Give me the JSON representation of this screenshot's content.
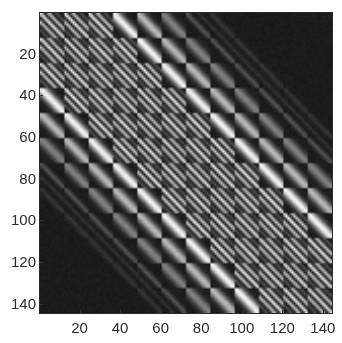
{
  "chart_data": {
    "type": "heatmap",
    "title": "",
    "xlabel": "",
    "ylabel": "",
    "colormap": "gray",
    "matrix_size": [
      144,
      144
    ],
    "block_size": 12,
    "num_blocks": 12,
    "xlim": [
      0.5,
      144.5
    ],
    "ylim": [
      144.5,
      0.5
    ],
    "y_axis_reversed": true,
    "x_ticks": [
      20,
      40,
      60,
      80,
      100,
      120,
      140
    ],
    "y_ticks": [
      20,
      40,
      60,
      80,
      100,
      120,
      140
    ],
    "x_tick_labels": [
      "20",
      "40",
      "60",
      "80",
      "100",
      "120",
      "140"
    ],
    "y_tick_labels": [
      "20",
      "40",
      "60",
      "80",
      "100",
      "120",
      "140"
    ],
    "grid": false,
    "legend": null,
    "structure": {
      "description": "12x12 block-banded matrix; each 12x12 block shows stripes parallel to the main diagonal with dark off-diagonal corners, giving a checkerboard look",
      "stripes_by_block_offset": [
        3,
        3,
        3,
        1,
        1,
        1,
        1,
        1,
        0,
        0,
        0,
        0
      ],
      "brightness_by_block_offset": [
        0.78,
        0.8,
        0.82,
        0.85,
        0.62,
        0.4,
        0.22,
        0.1,
        0.0,
        0.0,
        0.0,
        0.0
      ],
      "faint_diagonal_offset": 78,
      "background_level": 0.11
    }
  },
  "colors": {
    "background": "#1e1e1e",
    "page": "#ffffff",
    "tick_text": "#2b2b2b"
  }
}
